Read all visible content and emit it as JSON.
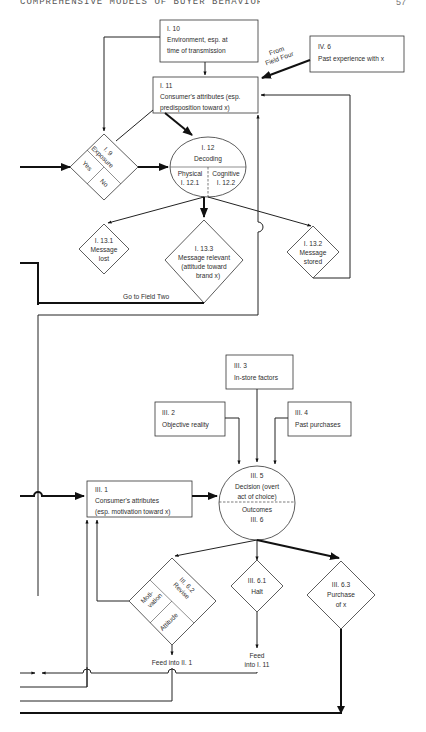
{
  "page": {
    "running_head": "COMPREHENSIVE MODELS OF BUYER BEHAVIOR",
    "page_number": "57"
  },
  "diagram": {
    "nodes": {
      "i10": {
        "id": "I. 10",
        "line1": "Environment, esp. at",
        "line2": "time of transmission",
        "shape": "box"
      },
      "iv6": {
        "id": "IV. 6",
        "line1": "Past experience with x",
        "shape": "box"
      },
      "from_field_four": {
        "line1": "From",
        "line2": "Field Four",
        "shape": "label"
      },
      "i11": {
        "id": "I. 11",
        "line1": "Consumer's attributes (esp.",
        "line2": "predisposition toward x)",
        "shape": "box"
      },
      "i9": {
        "id": "I. 9",
        "label": "Exposure",
        "yes": "Yes",
        "no": "No",
        "shape": "diamond"
      },
      "i12": {
        "id": "I. 12",
        "label": "Decoding",
        "left_label": "Physical",
        "left_id": "I. 12.1",
        "right_label": "Cognitive",
        "right_id": "I. 12.2",
        "shape": "ellipse"
      },
      "i13_1": {
        "id": "I. 13.1",
        "line1": "Message",
        "line2": "lost",
        "shape": "diamond"
      },
      "i13_3": {
        "id": "I. 13.3",
        "line1": "Message relevant",
        "line2": "(attitude toward",
        "line3": "brand x)",
        "shape": "diamond"
      },
      "i13_2": {
        "id": "I. 13.2",
        "line1": "Message",
        "line2": "stored",
        "shape": "diamond"
      },
      "go_field_two": {
        "label": "Go to Field Two",
        "shape": "label"
      },
      "iii3": {
        "id": "III. 3",
        "line1": "In-store factors",
        "shape": "box"
      },
      "iii2": {
        "id": "III. 2",
        "line1": "Objective reality",
        "shape": "box"
      },
      "iii4": {
        "id": "III. 4",
        "line1": "Past purchases",
        "shape": "box"
      },
      "iii5": {
        "id": "III. 5",
        "line1": "Decision (overt",
        "line2": "act of choice)",
        "outcomes_label": "Outcomes",
        "outcomes_id": "III. 6",
        "shape": "ellipse"
      },
      "iii1": {
        "id": "III. 1",
        "line1": "Consumer's attributes",
        "line2": "(esp. motivation toward x)",
        "shape": "box"
      },
      "iii6_2": {
        "id": "III. 6.2",
        "label": "Revise",
        "cell1a": "Moti-",
        "cell1b": "vation",
        "cell2": "Attitude",
        "shape": "diamond"
      },
      "iii6_1": {
        "id": "III. 6.1",
        "line1": "Halt",
        "shape": "diamond"
      },
      "iii6_3": {
        "id": "III. 6.3",
        "line1": "Purchase",
        "line2": "of x",
        "shape": "diamond"
      },
      "feed_ii1": {
        "label": "Feed into II. 1",
        "shape": "label"
      },
      "feed_i11": {
        "line1": "Feed",
        "line2": "into I. 11",
        "shape": "label"
      }
    },
    "colors": {
      "line": "#222222",
      "box_border": "#333333",
      "text": "#2e2e2e",
      "background": "#ffffff"
    }
  }
}
